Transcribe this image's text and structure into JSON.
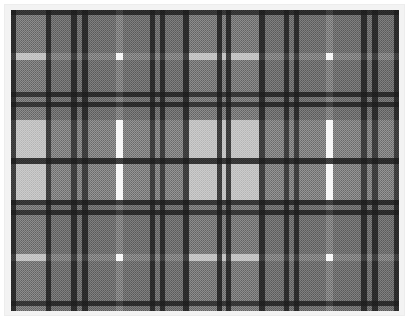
{
  "image": {
    "subject": "tartan-plaid-fabric-swatch",
    "width": 409,
    "height": 320,
    "background": "#ffffff",
    "mat_color": "#f3f3f3",
    "mat_border": "#ededed",
    "cloth": {
      "x": 11,
      "y": 10,
      "width": 388,
      "height": 301
    }
  },
  "palette": {
    "white": "#f7f7f7",
    "light_gray": "#b9b9b9",
    "dark_gray": "#6d6d6d",
    "black": "#1f1f1f",
    "base": "#b9b9b9"
  },
  "pattern": {
    "type": "tartan",
    "weave": "2x2 twill",
    "symmetry": "symmetric sett, mirrored",
    "warp_repeat_px": 117,
    "weft_repeat_px": 100
  },
  "chart_data": {
    "type": "heatmap",
    "xlabel": "warp (vertical stripes)",
    "ylabel": "weft (horizontal stripes)",
    "warp_stripes": [
      {
        "x": 0,
        "w": 5,
        "color": "#1f1f1f"
      },
      {
        "x": 5,
        "w": 30,
        "color": "#b9b9b9"
      },
      {
        "x": 35,
        "w": 5,
        "color": "#1f1f1f"
      },
      {
        "x": 40,
        "w": 20,
        "color": "#6d6d6d"
      },
      {
        "x": 60,
        "w": 6,
        "color": "#1f1f1f"
      },
      {
        "x": 66,
        "w": 5,
        "color": "#6d6d6d"
      },
      {
        "x": 71,
        "w": 6,
        "color": "#1f1f1f"
      },
      {
        "x": 77,
        "w": 28,
        "color": "#6d6d6d"
      },
      {
        "x": 105,
        "w": 7,
        "color": "#f7f7f7"
      },
      {
        "x": 112,
        "w": 27,
        "color": "#6d6d6d"
      },
      {
        "x": 139,
        "w": 5,
        "color": "#1f1f1f"
      },
      {
        "x": 144,
        "w": 5,
        "color": "#6d6d6d"
      },
      {
        "x": 149,
        "w": 5,
        "color": "#1f1f1f"
      },
      {
        "x": 154,
        "w": 18,
        "color": "#6d6d6d"
      },
      {
        "x": 172,
        "w": 6,
        "color": "#1f1f1f"
      },
      {
        "x": 178,
        "w": 28,
        "color": "#b9b9b9"
      },
      {
        "x": 206,
        "w": 5,
        "color": "#1f1f1f"
      },
      {
        "x": 211,
        "w": 4,
        "color": "#b9b9b9"
      },
      {
        "x": 215,
        "w": 5,
        "color": "#1f1f1f"
      },
      {
        "x": 220,
        "w": 28,
        "color": "#b9b9b9"
      },
      {
        "x": 248,
        "w": 6,
        "color": "#1f1f1f"
      },
      {
        "x": 254,
        "w": 19,
        "color": "#6d6d6d"
      },
      {
        "x": 273,
        "w": 5,
        "color": "#1f1f1f"
      },
      {
        "x": 278,
        "w": 5,
        "color": "#6d6d6d"
      },
      {
        "x": 283,
        "w": 5,
        "color": "#1f1f1f"
      },
      {
        "x": 288,
        "w": 27,
        "color": "#6d6d6d"
      },
      {
        "x": 315,
        "w": 7,
        "color": "#f7f7f7"
      },
      {
        "x": 322,
        "w": 28,
        "color": "#6d6d6d"
      },
      {
        "x": 350,
        "w": 6,
        "color": "#1f1f1f"
      },
      {
        "x": 356,
        "w": 5,
        "color": "#6d6d6d"
      },
      {
        "x": 361,
        "w": 6,
        "color": "#1f1f1f"
      },
      {
        "x": 367,
        "w": 16,
        "color": "#6d6d6d"
      },
      {
        "x": 383,
        "w": 5,
        "color": "#1f1f1f"
      }
    ],
    "weft_stripes": [
      {
        "y": 0,
        "h": 5,
        "color": "#1f1f1f"
      },
      {
        "y": 5,
        "h": 38,
        "color": "#6d6d6d"
      },
      {
        "y": 43,
        "h": 7,
        "color": "#f7f7f7"
      },
      {
        "y": 50,
        "h": 32,
        "color": "#6d6d6d"
      },
      {
        "y": 82,
        "h": 5,
        "color": "#1f1f1f"
      },
      {
        "y": 87,
        "h": 5,
        "color": "#6d6d6d"
      },
      {
        "y": 92,
        "h": 5,
        "color": "#1f1f1f"
      },
      {
        "y": 97,
        "h": 13,
        "color": "#6d6d6d"
      },
      {
        "y": 110,
        "h": 38,
        "color": "#f7f7f7"
      },
      {
        "y": 148,
        "h": 6,
        "color": "#1f1f1f"
      },
      {
        "y": 154,
        "h": 36,
        "color": "#f7f7f7"
      },
      {
        "y": 190,
        "h": 5,
        "color": "#1f1f1f"
      },
      {
        "y": 195,
        "h": 5,
        "color": "#6d6d6d"
      },
      {
        "y": 200,
        "h": 5,
        "color": "#1f1f1f"
      },
      {
        "y": 205,
        "h": 39,
        "color": "#6d6d6d"
      },
      {
        "y": 244,
        "h": 7,
        "color": "#f7f7f7"
      },
      {
        "y": 251,
        "h": 40,
        "color": "#6d6d6d"
      },
      {
        "y": 291,
        "h": 5,
        "color": "#1f1f1f"
      },
      {
        "y": 296,
        "h": 5,
        "color": "#6d6d6d"
      }
    ]
  }
}
